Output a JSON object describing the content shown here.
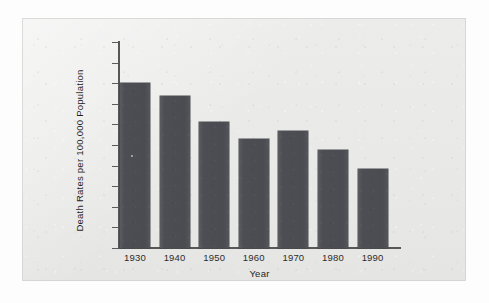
{
  "chart_data": {
    "type": "bar",
    "title": "",
    "subtitle": "",
    "xlabel": "Year",
    "ylabel": "Death Rates per 100,000 Population",
    "categories": [
      "1930",
      "1940",
      "1950",
      "1960",
      "1970",
      "1980",
      "1990"
    ],
    "values": [
      80,
      74,
      61,
      53,
      57,
      47.5,
      38.5
    ],
    "series": [
      {
        "name": "Death Rates per 100,000 Population",
        "values": [
          80,
          74,
          61,
          53,
          57,
          47.5,
          38.5
        ]
      }
    ],
    "ylim": [
      0,
      100
    ],
    "ytick_labels": [
      "0",
      "10",
      "20",
      "30",
      "40",
      "50",
      "60",
      "70",
      "80",
      "90",
      "100"
    ],
    "ytick_values": [
      0,
      10,
      20,
      30,
      40,
      50,
      60,
      70,
      80,
      90,
      100
    ],
    "xtick_labels": [
      "1930",
      "1940",
      "1950",
      "1960",
      "1970",
      "1980",
      "1990"
    ],
    "grid": false,
    "legend": false,
    "legend_position": "none",
    "annotations": []
  },
  "style": {
    "bar_color": "#4c4e53",
    "axis_color": "#575757",
    "text_color": "#1f1f1f",
    "panel_background": "#e9e9e7",
    "page_background": "#fdfdfd"
  }
}
